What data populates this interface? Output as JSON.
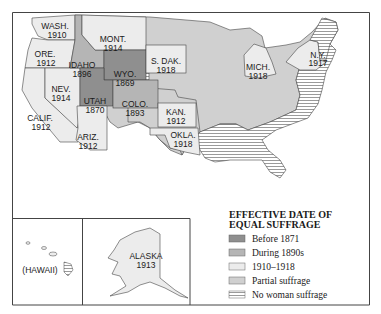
{
  "map": {
    "title": "EFFECTIVE DATE OF EQUAL SUFFRAGE",
    "colors": {
      "before_1871": "#8f8f8f",
      "during_1890s": "#b5b5b5",
      "1910_1918": "#ececec",
      "partial": "#d0d0d0",
      "none": "#ffffff",
      "border": "#444444"
    },
    "states": [
      {
        "abbr": "WASH.",
        "year": "1910",
        "category": "1910-1918"
      },
      {
        "abbr": "ORE.",
        "year": "1912",
        "category": "1910-1918"
      },
      {
        "abbr": "CALIF.",
        "year": "1912",
        "category": "1910-1918"
      },
      {
        "abbr": "IDAHO",
        "year": "1896",
        "category": "During 1890s"
      },
      {
        "abbr": "NEV.",
        "year": "1914",
        "category": "1910-1918"
      },
      {
        "abbr": "MONT.",
        "year": "1914",
        "category": "1910-1918"
      },
      {
        "abbr": "WYO.",
        "year": "1869",
        "category": "Before 1871"
      },
      {
        "abbr": "UTAH",
        "year": "1870",
        "category": "Before 1871"
      },
      {
        "abbr": "COLO.",
        "year": "1893",
        "category": "During 1890s"
      },
      {
        "abbr": "ARIZ.",
        "year": "1912",
        "category": "1910-1918"
      },
      {
        "abbr": "S. DAK.",
        "year": "1918",
        "category": "1910-1918"
      },
      {
        "abbr": "KAN.",
        "year": "1912",
        "category": "1910-1918"
      },
      {
        "abbr": "OKLA.",
        "year": "1918",
        "category": "1910-1918"
      },
      {
        "abbr": "MICH.",
        "year": "1918",
        "category": "1910-1918"
      },
      {
        "abbr": "N.Y.",
        "year": "1917",
        "category": "1910-1918"
      },
      {
        "abbr": "ALASKA",
        "year": "1913",
        "category": "1910-1918"
      },
      {
        "abbr": "(HAWAII)",
        "year": "",
        "category": "No woman suffrage"
      }
    ],
    "legend": {
      "title_line1": "EFFECTIVE DATE OF",
      "title_line2": "EQUAL SUFFRAGE",
      "items": [
        {
          "label": "Before 1871",
          "swatch": "before_1871"
        },
        {
          "label": "During 1890s",
          "swatch": "during_1890s"
        },
        {
          "label": "1910–1918",
          "swatch": "1910_1918"
        },
        {
          "label": "Partial suffrage",
          "swatch": "partial"
        },
        {
          "label": "No woman suffrage",
          "swatch": "none"
        }
      ]
    }
  }
}
